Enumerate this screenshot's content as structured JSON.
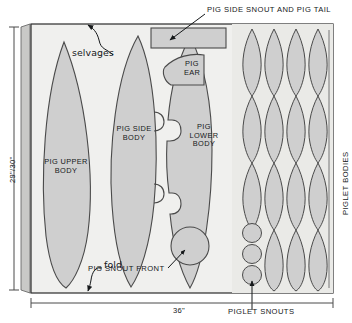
{
  "diagram": {
    "title_callouts": {
      "top": "PIG SIDE SNOUT AND PIG TAIL",
      "bottom": "PIGLET SNOUTS"
    },
    "dimensions": {
      "height_label": "29\"/30\"",
      "width_label": "36\""
    },
    "edge_labels": {
      "selvages": "selvages",
      "fold": "fold"
    },
    "pieces": [
      {
        "id": "pig-upper-body",
        "label_line1": "PIG UPPER",
        "label_line2": "BODY"
      },
      {
        "id": "pig-side-body",
        "label_line1": "PIG SIDE",
        "label_line2": "BODY"
      },
      {
        "id": "pig-lower-body",
        "label_line1": "PIG",
        "label_line2": "LOWER",
        "label_line3": "BODY"
      },
      {
        "id": "pig-ear",
        "label_line1": "PIG",
        "label_line2": "EAR"
      }
    ],
    "labels": {
      "pig_snout_front": "PIG SNOUT FRONT",
      "piglet_bodies": "PIGLET BODIES"
    },
    "colors": {
      "fabric_fill": "#f0f0ee",
      "piece_fill": "#cfcfcf",
      "piece_stroke": "#4a4a4a",
      "fabric_stroke": "#2b2b2b",
      "ink": "#15181a",
      "selvage_strip": "#c9c9c7"
    },
    "counts": {
      "piglet_body_columns": 4,
      "piglet_body_rows": 4,
      "piglet_snout_circles": 3
    }
  }
}
